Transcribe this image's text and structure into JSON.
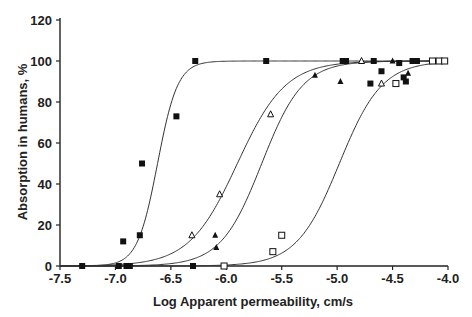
{
  "chart_data": {
    "type": "scatter",
    "title": "",
    "xlabel": "Log Apparent permeability, cm/s",
    "ylabel": "Absorption in humans, %",
    "xlim": [
      -7.5,
      -4.0
    ],
    "ylim": [
      0,
      120
    ],
    "x_ticks": [
      -7.5,
      -7.0,
      -6.5,
      -6.0,
      -5.5,
      -5.0,
      -4.5,
      -4.0
    ],
    "x_tick_labels": [
      "-7.5",
      "-7.0",
      "-6.5",
      "-6.0",
      "-5.5",
      "-5.0",
      "-4.5",
      "-4.0"
    ],
    "y_ticks": [
      0,
      20,
      40,
      60,
      80,
      100,
      120
    ],
    "y_tick_labels": [
      "0",
      "20",
      "40",
      "60",
      "80",
      "100",
      "120"
    ],
    "grid": false,
    "legend": null,
    "curves": [
      {
        "name": "sigmoid fit 1",
        "midpoint": -6.62,
        "slope": 11.0
      },
      {
        "name": "sigmoid fit 2",
        "midpoint": -5.9,
        "slope": 4.6
      },
      {
        "name": "sigmoid fit 3",
        "midpoint": -5.68,
        "slope": 5.4
      },
      {
        "name": "sigmoid fit 4",
        "midpoint": -4.98,
        "slope": 5.2
      }
    ],
    "series": [
      {
        "name": "filled squares",
        "marker": "filled-square",
        "points": [
          [
            -7.3,
            0
          ],
          [
            -6.97,
            0
          ],
          [
            -6.9,
            0
          ],
          [
            -6.87,
            0
          ],
          [
            -6.3,
            0
          ],
          [
            -6.93,
            12
          ],
          [
            -6.78,
            15
          ],
          [
            -6.76,
            50
          ],
          [
            -6.45,
            73
          ],
          [
            -6.28,
            100
          ],
          [
            -5.64,
            100
          ],
          [
            -4.95,
            100
          ],
          [
            -4.92,
            100
          ],
          [
            -4.67,
            100
          ],
          [
            -4.44,
            99
          ],
          [
            -4.32,
            100
          ],
          [
            -4.28,
            100
          ],
          [
            -4.6,
            95
          ],
          [
            -4.7,
            89
          ],
          [
            -4.4,
            92
          ],
          [
            -4.38,
            90
          ]
        ]
      },
      {
        "name": "open triangles",
        "marker": "open-triangle",
        "points": [
          [
            -6.31,
            15
          ],
          [
            -6.06,
            35
          ],
          [
            -5.6,
            74
          ],
          [
            -4.78,
            100
          ],
          [
            -4.6,
            89
          ]
        ]
      },
      {
        "name": "filled triangles",
        "marker": "filled-triangle",
        "points": [
          [
            -6.1,
            15
          ],
          [
            -6.09,
            9
          ],
          [
            -5.2,
            93
          ],
          [
            -4.97,
            90
          ],
          [
            -4.5,
            100
          ],
          [
            -4.36,
            94
          ]
        ]
      },
      {
        "name": "open squares",
        "marker": "open-square",
        "points": [
          [
            -6.02,
            0
          ],
          [
            -5.58,
            7
          ],
          [
            -5.5,
            15
          ],
          [
            -4.47,
            89
          ],
          [
            -4.14,
            100
          ],
          [
            -4.08,
            100
          ],
          [
            -4.03,
            100
          ]
        ]
      }
    ]
  }
}
